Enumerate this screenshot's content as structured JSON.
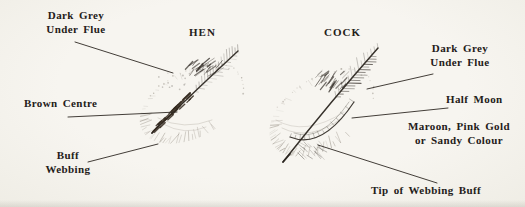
{
  "diagram": {
    "hen": {
      "title": "HEN",
      "labels": {
        "under_flue": {
          "line1": "Dark Grey",
          "line2": "Under Flue"
        },
        "brown_centre": {
          "line1": "Brown Centre"
        },
        "buff_webbing": {
          "line1": "Buff",
          "line2": "Webbing"
        }
      }
    },
    "cock": {
      "title": "COCK",
      "labels": {
        "under_flue": {
          "line1": "Dark Grey",
          "line2": "Under Flue"
        },
        "half_moon": {
          "line1": "Half Moon"
        },
        "maroon": {
          "line1": "Maroon, Pink Gold",
          "line2": "or Sandy Colour"
        },
        "tip_webbing": {
          "line1": "Tip of Webbing Buff"
        }
      }
    },
    "colors": {
      "paper": "#f5f3ee",
      "text_ink": "#242019",
      "leader_line": "#332e28",
      "shaft_ink": "#2b2620",
      "feather_dark": "#36302a",
      "feather_mid": "#55504a",
      "feather_light": "#7d7569",
      "brown_centre": "#33281d"
    }
  }
}
